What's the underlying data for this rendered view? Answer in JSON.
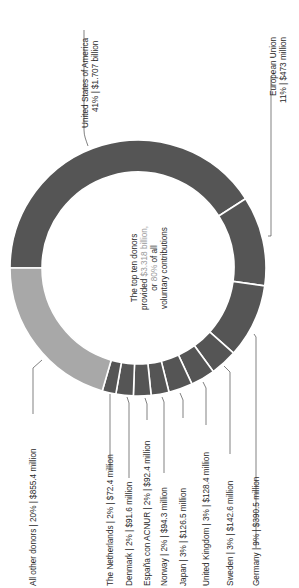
{
  "chart_data": {
    "type": "pie",
    "subtype": "donut",
    "orientation": "rotated 90deg counter-clockwise",
    "title": "",
    "center_text": {
      "line1": "The top ten donors",
      "line2_prefix": "provided ",
      "line2_highlight": "$3.318 billion,",
      "line3_prefix": "or ",
      "line3_highlight": "80%",
      "line3_suffix": " of all",
      "line4": "voluntary contributions"
    },
    "categories": [
      "United States of America",
      "European Union",
      "Germany",
      "Sweden",
      "United Kingdom",
      "Japan",
      "Norway",
      "España con ACNUR",
      "Denmark",
      "The Netherlands",
      "All other donors"
    ],
    "percent": [
      41,
      11,
      9,
      3,
      3,
      3,
      2,
      2,
      2,
      2,
      20
    ],
    "values_usd_millions": [
      1707,
      473,
      390.5,
      142.6,
      128.4,
      126.5,
      94.3,
      92.4,
      91.6,
      72.4,
      855.4
    ],
    "value_labels": [
      "41% | $1.707 billion",
      "11% | $473 million",
      "9% | $390.5 million",
      "3% | $142.6 million",
      "3% | $128.4 million",
      "3% | $126.5 million",
      "2% | $94.3 million",
      "2% | $92.4 million",
      "2% | $91.6 million",
      "2% | $72.4 million",
      "20% | $855.4 million"
    ],
    "colors": {
      "top_donors": "#555555",
      "other_donors": "#a8a8a8",
      "separator": "#ffffff",
      "highlight_text": "#9a9a9a"
    },
    "legend": "none (direct labels with leader lines)"
  },
  "labels": {
    "usa_name": "United States of America",
    "usa_value": "41% | $1.707 billion",
    "eu_name": "European Union",
    "eu_value": "11% | $473 million",
    "germany": "Germany | 9% | $390.5 million",
    "sweden": "Sweden | 3% | $142.6 million",
    "uk": "United Kingdom | 3% | $128.4 million",
    "japan": "Japan | 3% | $126.5 million",
    "norway": "Norway | 2% | $94.3 million",
    "espana": "España con ACNUR | 2% | $92.4 million",
    "denmark": "Denmark | 2% | $91.6 million",
    "netherlands": "The Netherlands | 2% | $72.4 million",
    "others": "All other donors | 20% | $855.4 million"
  }
}
